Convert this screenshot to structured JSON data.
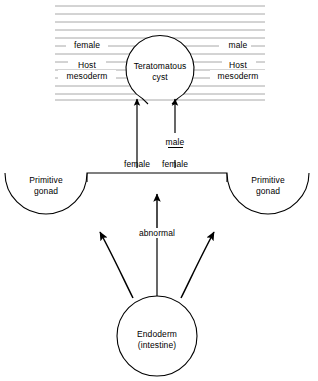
{
  "diagram": {
    "type": "biological-flow-diagram",
    "background_color": "#ffffff",
    "stroke_color": "#000000",
    "hatch_color": "#a8a8a8",
    "nodes": {
      "teratomatous_cyst": {
        "label_line1": "Teratomatous",
        "label_line2": "cyst",
        "shape": "circle-with-bottom-gap",
        "cx": 160,
        "cy": 68,
        "r": 34
      },
      "host_mesoderm_left": {
        "label_line1": "Host",
        "label_line2": "mesoderm",
        "cx": 87,
        "cy": 66
      },
      "host_mesoderm_right": {
        "label_line1": "Host",
        "label_line2": "mesoderm",
        "cx": 238,
        "cy": 66
      },
      "female_top_left": {
        "label": "female",
        "cx": 87,
        "cy": 45
      },
      "male_top_right": {
        "label": "male",
        "cx": 238,
        "cy": 45
      },
      "primitive_gonad_left": {
        "label_line1": "Primitive",
        "label_line2": "gonad",
        "shape": "semicircle-bottom",
        "cx": 46,
        "cy": 174,
        "r": 41
      },
      "primitive_gonad_right": {
        "label_line1": "Primitive",
        "label_line2": "gonad",
        "shape": "semicircle-bottom",
        "cx": 268,
        "cy": 174,
        "r": 41
      },
      "endoderm": {
        "label_line1": "Endoderm",
        "label_line2": "(intestine)",
        "shape": "circle",
        "cx": 157,
        "cy": 336,
        "r": 40
      }
    },
    "edge_labels": {
      "female_left_arrow": "female",
      "male_over_female_top": "male",
      "male_over_female_bottom": "female",
      "abnormal": "abnormal"
    }
  }
}
